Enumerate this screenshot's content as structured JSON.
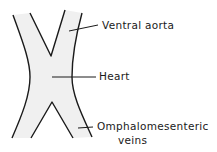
{
  "figure": {
    "labels": {
      "ventral_aorta": "Ventral aorta",
      "heart": "Heart",
      "omphalomesenteric_line1": "Omphalomesenteric",
      "omphalomesenteric_line2": "veins"
    },
    "colors": {
      "outline": "#1a1a1a",
      "fill": "#efefef",
      "background": "#ffffff"
    }
  }
}
